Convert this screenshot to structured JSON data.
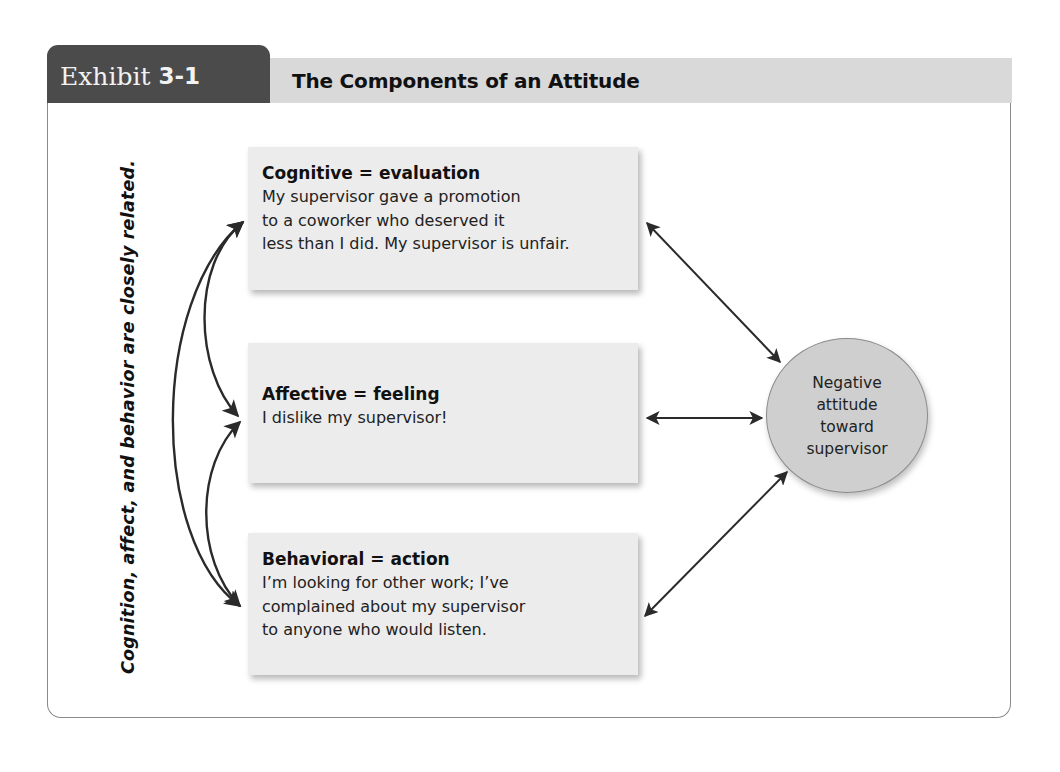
{
  "exhibit": {
    "label": "Exhibit",
    "number": "3-1",
    "title": "The Components of an Attitude"
  },
  "side_caption": "Cognition, affect, and behavior are closely related.",
  "components": [
    {
      "heading": "Cognitive = evaluation",
      "lines": [
        "My supervisor gave a promotion",
        "to a coworker who deserved it",
        "less than I did. My supervisor is unfair."
      ]
    },
    {
      "heading": "Affective = feeling",
      "lines": [
        "I dislike my supervisor!"
      ]
    },
    {
      "heading": "Behavioral = action",
      "lines": [
        "I’m looking for other work; I’ve",
        "complained about my supervisor",
        "to anyone who would listen."
      ]
    }
  ],
  "outcome": {
    "lines": [
      "Negative",
      "attitude",
      "toward",
      "supervisor"
    ]
  },
  "colors": {
    "tab": "#4b4b4b",
    "title_bar": "#d9d9d9",
    "box_fill": "#ececec",
    "circle_fill": "#cfcfcf",
    "arrow": "#2a2a2a"
  }
}
